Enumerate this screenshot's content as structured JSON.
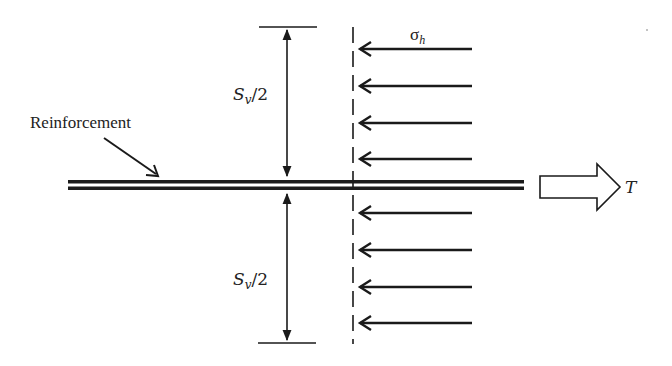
{
  "diagram": {
    "labels": {
      "reinforcement": "Reinforcement",
      "spacing_var": "S",
      "spacing_sub": "v",
      "spacing_rest": "/2",
      "stress_var": "σ",
      "stress_sub": "h",
      "tension": "T"
    },
    "elements": {
      "reinforcement_strip": "double horizontal line",
      "dimension_upper": "S_v/2 above reinforcement",
      "dimension_lower": "S_v/2 below reinforcement",
      "dashed_boundary": "vertical dashed line",
      "stress_arrows_count": 8,
      "tension_arrow": "hollow right-pointing arrow"
    },
    "colors": {
      "stroke": "#1a1a1a",
      "background": "#ffffff"
    }
  }
}
